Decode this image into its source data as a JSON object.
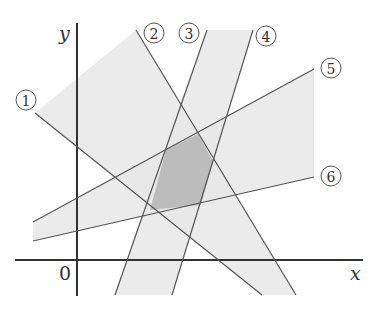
{
  "diagram": {
    "axes": {
      "x_label": "x",
      "y_label": "y",
      "origin_label": "0",
      "x_axis": {
        "x1": 15,
        "y1": 260,
        "x2": 363,
        "y2": 260
      },
      "y_axis": {
        "x1": 77,
        "y1": 23,
        "x2": 77,
        "y2": 296
      }
    },
    "lines": [
      {
        "id": "1",
        "label": "①",
        "x1": 35,
        "y1": 113,
        "x2": 262,
        "y2": 295,
        "label_pos": [
          25,
          100
        ]
      },
      {
        "id": "2",
        "label": "②",
        "x1": 136,
        "y1": 30,
        "x2": 296,
        "y2": 295,
        "label_pos": [
          154,
          33
        ]
      },
      {
        "id": "3",
        "label": "③",
        "x1": 207,
        "y1": 30,
        "x2": 115,
        "y2": 295,
        "label_pos": [
          189,
          33
        ]
      },
      {
        "id": "4",
        "label": "④",
        "x1": 253,
        "y1": 30,
        "x2": 172,
        "y2": 295,
        "label_pos": [
          266,
          36
        ]
      },
      {
        "id": "5",
        "label": "⑤",
        "x1": 33,
        "y1": 222,
        "x2": 314,
        "y2": 69,
        "label_pos": [
          331,
          68
        ]
      },
      {
        "id": "6",
        "label": "⑥",
        "x1": 33,
        "y1": 241,
        "x2": 314,
        "y2": 177,
        "label_pos": [
          331,
          176
        ]
      }
    ],
    "regions": [
      {
        "name": "band-1-2",
        "shade": "light",
        "points": "35,113 136,30 296,295 262,295"
      },
      {
        "name": "band-3-4",
        "shade": "light",
        "points": "207,30 253,30 172,295 115,295"
      },
      {
        "name": "band-5-6",
        "shade": "light",
        "points": "33,222 314,69 314,177 33,241"
      },
      {
        "name": "intersection",
        "shade": "dark",
        "points": "166,150 198,134 213,161 201,205 150,210"
      }
    ],
    "colors": {
      "light_fill": "#e6e6e6",
      "dark_fill": "#bdbdbd",
      "line": "#555555"
    }
  }
}
